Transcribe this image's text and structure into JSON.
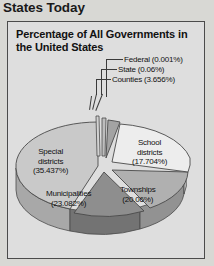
{
  "page": {
    "title": "States Today"
  },
  "chart_panel": {
    "title": "Percentage of All Governments in the United States"
  },
  "callouts": [
    {
      "name": "federal",
      "label": "Federal (0.001%)"
    },
    {
      "name": "state",
      "label": "State (0.06%)"
    },
    {
      "name": "counties",
      "label": "Counties (3.656%)"
    }
  ],
  "slice_labels": {
    "school": "School\ndistricts\n(17.704%)",
    "special": "Special\ndistricts\n(35.437%)",
    "townships": "Townships\n(20.06%)",
    "municipal": "Municipalities\n(23.082%)"
  },
  "colors": {
    "panel_background": "#dedede",
    "page_background": "#d8d8d4",
    "panel_border": "#4b4b4b",
    "slice_special": "#c9c9c9",
    "slice_school": "#e9e9e9",
    "slice_townships": "#b0b0b0",
    "slice_municipalities": "#8e8e8e",
    "slice_counties": "#a3a3a3",
    "slice_state": "#bdbdbd",
    "slice_federal": "#d2d2d2",
    "outline": "#4a4a4a"
  },
  "chart_data": {
    "type": "pie",
    "title": "Percentage of All Governments in the United States",
    "categories": [
      "Federal",
      "State",
      "Counties",
      "School districts",
      "Townships",
      "Municipalities",
      "Special districts"
    ],
    "values": [
      0.001,
      0.06,
      3.656,
      17.704,
      20.06,
      23.082,
      35.437
    ],
    "value_labels": [
      "0.001%",
      "0.06%",
      "3.656%",
      "17.704%",
      "20.06%",
      "23.082%",
      "35.437%"
    ],
    "unit": "percent",
    "exploded": true,
    "three_d": true,
    "legend": "none",
    "annotations": [
      "Federal (0.001%)",
      "State (0.06%)",
      "Counties (3.656%)",
      "School districts (17.704%)",
      "Townships (20.06%)",
      "Municipalities (23.082%)",
      "Special districts (35.437%)"
    ]
  }
}
